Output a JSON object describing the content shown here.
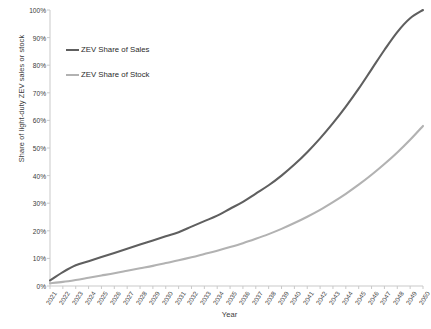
{
  "chart_data": {
    "type": "line",
    "title": "",
    "xlabel": "Year",
    "ylabel": "Share of light-duty ZEV sales or stock",
    "grid": false,
    "legend_position": "upper-left-inside",
    "xlim": [
      2021,
      2050
    ],
    "ylim": [
      0,
      100
    ],
    "ytick_labels": [
      "0%",
      "10%",
      "20%",
      "30%",
      "40%",
      "50%",
      "60%",
      "70%",
      "80%",
      "90%",
      "100%"
    ],
    "ytick_values": [
      0,
      10,
      20,
      30,
      40,
      50,
      60,
      70,
      80,
      90,
      100
    ],
    "x": [
      2021,
      2022,
      2023,
      2024,
      2025,
      2026,
      2027,
      2028,
      2029,
      2030,
      2031,
      2032,
      2033,
      2034,
      2035,
      2036,
      2037,
      2038,
      2039,
      2040,
      2041,
      2042,
      2043,
      2044,
      2045,
      2046,
      2047,
      2048,
      2049,
      2050
    ],
    "categories": [
      "2021",
      "2022",
      "2023",
      "2024",
      "2025",
      "2026",
      "2027",
      "2028",
      "2029",
      "2030",
      "2031",
      "2032",
      "2033",
      "2034",
      "2035",
      "2036",
      "2037",
      "2038",
      "2039",
      "2040",
      "2041",
      "2042",
      "2043",
      "2044",
      "2045",
      "2046",
      "2047",
      "2048",
      "2049",
      "2050"
    ],
    "series": [
      {
        "name": "ZEV Share of Sales",
        "color": "#5f5f5f",
        "values": [
          2,
          5,
          7.5,
          9,
          10.5,
          12,
          13.5,
          15,
          16.5,
          18,
          19.5,
          21.5,
          23.5,
          25.5,
          28,
          30.5,
          33.5,
          36.5,
          40,
          44,
          48.5,
          53.5,
          59,
          65,
          71.5,
          78.5,
          85.5,
          92,
          97,
          100
        ]
      },
      {
        "name": "ZEV Share of Stock",
        "color": "#b2b2b2",
        "values": [
          1,
          1.5,
          2.2,
          3,
          3.8,
          4.6,
          5.5,
          6.4,
          7.3,
          8.3,
          9.3,
          10.4,
          11.6,
          12.8,
          14.1,
          15.5,
          17.1,
          18.8,
          20.7,
          22.8,
          25.1,
          27.6,
          30.4,
          33.4,
          36.7,
          40.3,
          44.2,
          48.4,
          53.0,
          58.0
        ]
      }
    ]
  },
  "axes": {
    "xlabel_text": "Year",
    "ylabel_text": "Share of light-duty ZEV sales or stock"
  },
  "legend": {
    "items": [
      {
        "label": "ZEV Share of Sales",
        "color": "#5f5f5f"
      },
      {
        "label": "ZEV Share of Stock",
        "color": "#b2b2b2"
      }
    ]
  },
  "colors": {
    "sales_line": "#5f5f5f",
    "stock_line": "#b2b2b2",
    "axis": "#c8c8c8",
    "text": "#3a3a3a",
    "background": "#ffffff"
  }
}
